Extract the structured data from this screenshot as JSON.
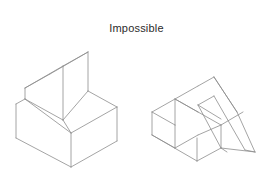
{
  "figure": {
    "caption": "Impossible",
    "caption_color": "#2b2b2b",
    "background_color": "#ffffff",
    "line_color": "#8d8d8d",
    "line_width_px": 0.8,
    "width_px": 273,
    "height_px": 181,
    "object_count": 2,
    "projection": "isometric",
    "render_style": "wireframe-line-drawing"
  },
  "objects": [
    {
      "id": "left-object",
      "name": "slotted-block-with-ramp",
      "description": "Isometric block with a raised vertical fin on the left, an open channel, and an inclined ramp face rising to the right",
      "bounds": {
        "x": 14,
        "y": 46,
        "width": 104,
        "height": 118
      }
    },
    {
      "id": "right-object",
      "name": "recessed-block-with-wedge",
      "description": "Isometric block with a rectangular recessed pocket and a triangular sloped wedge on the right side",
      "bounds": {
        "x": 152,
        "y": 60,
        "width": 107,
        "height": 98
      }
    }
  ]
}
